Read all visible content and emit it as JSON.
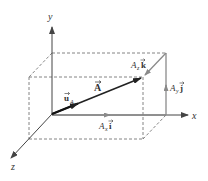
{
  "diagram": {
    "type": "3d-vector-decomposition",
    "axes": {
      "x_label": "x",
      "y_label": "y",
      "z_label": "z"
    },
    "vectors": {
      "A": {
        "label": "A",
        "has_arrow_accent": true
      },
      "unit_A": {
        "label": "u",
        "subscript": "A",
        "has_arrow_accent": true
      },
      "Ax_i": {
        "coef": "A",
        "coef_sub": "x",
        "unit": "i"
      },
      "Ay_j": {
        "coef": "A",
        "coef_sub": "y",
        "unit": "j"
      },
      "Az_k": {
        "coef": "A",
        "coef_sub": "z",
        "unit": "k"
      }
    },
    "colors": {
      "axis": "#444444",
      "vector_A": "#222222",
      "components": "#8a8a8a",
      "dashed_box": "#777777"
    }
  }
}
